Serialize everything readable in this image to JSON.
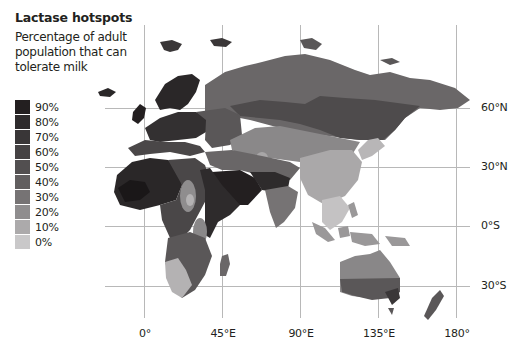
{
  "title": "Lactase hotspots",
  "subtitle": "Percentage of adult population that can tolerate milk",
  "legend": [
    {
      "label": "90%",
      "color": "#231f20"
    },
    {
      "label": "80%",
      "color": "#2e2b2c"
    },
    {
      "label": "70%",
      "color": "#393637"
    },
    {
      "label": "60%",
      "color": "#454243"
    },
    {
      "label": "50%",
      "color": "#524f50"
    },
    {
      "label": "40%",
      "color": "#615e5f"
    },
    {
      "label": "30%",
      "color": "#767374"
    },
    {
      "label": "20%",
      "color": "#8f8d8e"
    },
    {
      "label": "10%",
      "color": "#acaaab"
    },
    {
      "label": "0%",
      "color": "#c9c8c9"
    }
  ],
  "latitude_labels": [
    "60°N",
    "30°N",
    "0°S",
    "30°S"
  ],
  "longitude_labels": [
    "0°",
    "45°E",
    "90°E",
    "135°E",
    "180°"
  ],
  "grid_color": "#b8b8b8"
}
